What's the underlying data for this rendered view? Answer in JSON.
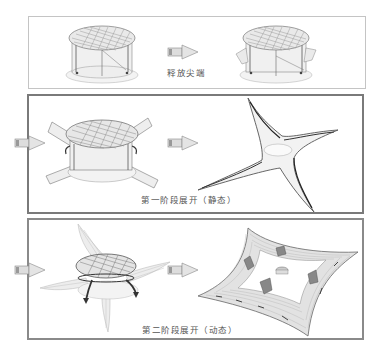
{
  "diagram": {
    "type": "deployment-sequence",
    "stages": [
      {
        "id": "stage-1",
        "caption": "释放尖端",
        "left_figure": "folded-circular-device",
        "right_figure": "device-tips-released"
      },
      {
        "id": "stage-2",
        "caption": "第一阶段展开（静态）",
        "left_figure": "device-with-four-arms-extended",
        "right_figure": "four-armed-star-frame"
      },
      {
        "id": "stage-3",
        "caption": "第二阶段展开（动态）",
        "left_figure": "device-with-membrane-unfolding",
        "right_figure": "fully-deployed-square-membrane"
      }
    ],
    "arrow_icon": "right-arrow-icon",
    "colors": {
      "panel1_border": "#c4c4c4",
      "panel2_border": "#7a7a7a",
      "panel3_border": "#8a8a8a",
      "line": "#555555",
      "fill_light": "#e6e6e6"
    }
  }
}
